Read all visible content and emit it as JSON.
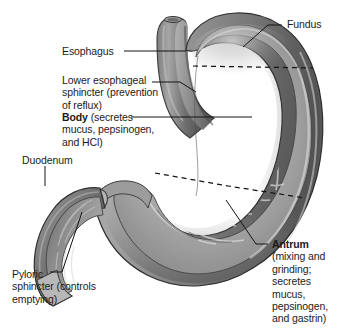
{
  "figure": {
    "background_color": "#ffffff",
    "line_color": "#1b1b1b",
    "wall_colors": {
      "outer_dark": "#6f6f6f",
      "outer_mid": "#8d8d8d",
      "outer_light": "#b9b9b9",
      "mucosa_mid": "#979797",
      "mucosa_light": "#c8c8c8",
      "rugae_highlight": "#d8d8d8",
      "shadow": "#4f4f4f",
      "serosa_highlight": "#e8e8e8"
    }
  },
  "labels": {
    "fundus": {
      "head": "Fundus",
      "detail": ""
    },
    "esophagus": {
      "head": "Esophagus",
      "detail": ""
    },
    "lower_esophageal_sphincter": {
      "head": "",
      "detail": "Lower esophageal\nsphincter (prevention\nof reflux)"
    },
    "body": {
      "head": "Body",
      "detail": " (secretes\nmucus, pepsinogen,\nand HCl)"
    },
    "duodenum": {
      "head": "Duodenum",
      "detail": ""
    },
    "pyloric_sphincter": {
      "head": "",
      "detail": "Pyloric\nsphincter (controls\nemptying)"
    },
    "antrum": {
      "head": "Antrum",
      "detail": "\n(mixing and\ngrinding;\nsecretes\nmucus,\npepsinogen,\nand gastrin)"
    }
  },
  "regions": [
    {
      "name": "fundus",
      "description": "Upper dome of the stomach above the dashed boundary line"
    },
    {
      "name": "body",
      "description": "Central region; secretes mucus, pepsinogen, and HCl"
    },
    {
      "name": "antrum",
      "description": "Lower region; mixing and grinding; secretes mucus, pepsinogen, and gastrin"
    },
    {
      "name": "esophagus",
      "description": "Tube entering stomach at upper left"
    },
    {
      "name": "duodenum",
      "description": "Cut C-shaped tube at lower left"
    }
  ],
  "boundary_lines": [
    {
      "name": "fundus-body-boundary",
      "style": "dashed"
    },
    {
      "name": "body-antrum-boundary",
      "style": "dashed"
    }
  ]
}
